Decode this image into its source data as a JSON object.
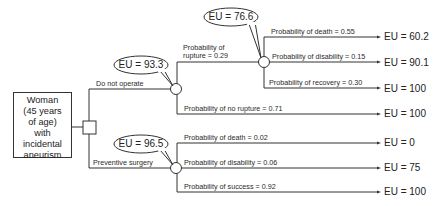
{
  "root": {
    "lines": [
      "Woman",
      "(45 years",
      "of age)",
      "with",
      "incidental",
      "aneurism"
    ]
  },
  "decisions": [
    {
      "label": "Do not operate",
      "eu_bubble": "EU = 93.3",
      "chance": {
        "branches": [
          {
            "label_lines": [
              "Probability of",
              "rupture = 0.29"
            ],
            "eu_bubble": "EU = 76.6",
            "outcomes": [
              {
                "label": "Probability of death = 0.55",
                "eu": "EU = 60.2"
              },
              {
                "label": "Probability of disability = 0.15",
                "eu": "EU = 90.1"
              },
              {
                "label": "Probability of recovery = 0.30",
                "eu": "EU = 100"
              }
            ]
          },
          {
            "label": "Probability of no rupture = 0.71",
            "eu": "EU = 100"
          }
        ]
      }
    },
    {
      "label": "Preventive surgery",
      "eu_bubble": "EU = 96.5",
      "outcomes": [
        {
          "label": "Probability of death = 0.02",
          "eu": "EU = 0"
        },
        {
          "label": "Probability of disability = 0.06",
          "eu": "EU = 75"
        },
        {
          "label": "Probability of success = 0.92",
          "eu": "EU = 100"
        }
      ]
    }
  ],
  "colors": {
    "line": "#333333",
    "background": "#ffffff"
  }
}
